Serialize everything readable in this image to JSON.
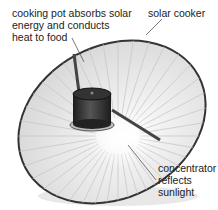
{
  "diagram": {
    "title": "Solar cooker",
    "labels": {
      "pot": "cooking pot absorbs solar\nenergy and conducts\nheat to food",
      "cooker": "solar cooker",
      "concentrator": "concentrator\nreflects\nsunlight"
    },
    "colors": {
      "dish_rim": "#333333",
      "dish_fill": "#f2f2f2",
      "ribs": "#c8c8c8",
      "pot": "#2a2a2a",
      "support_arm": "#444444",
      "leader_line": "#555555"
    },
    "rib_count": 40
  }
}
